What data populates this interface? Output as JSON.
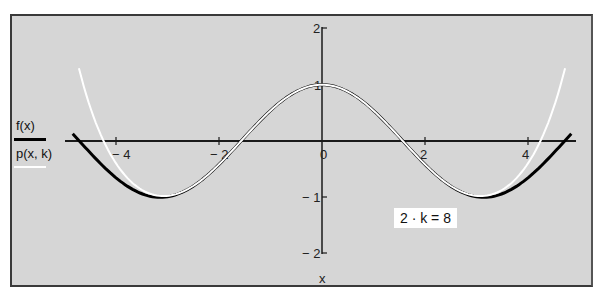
{
  "chart_data": {
    "type": "line",
    "title": "",
    "xlabel": "x",
    "ylabel": "",
    "xlim": [
      -4.9,
      4.9
    ],
    "ylim": [
      -2,
      2
    ],
    "x_ticks": [
      -4,
      -2,
      0,
      2,
      4
    ],
    "x_tick_labels": [
      "− 4",
      "− 2",
      "0",
      "2",
      "4"
    ],
    "y_ticks": [
      2,
      1,
      -1,
      -2
    ],
    "y_tick_labels": [
      "2",
      "1",
      "− 1",
      "− 2"
    ],
    "grid": false,
    "legend_position": "left",
    "series": [
      {
        "name": "f(x)",
        "color": "#000000",
        "description": "cos(x)",
        "x": [
          -4.8,
          -4.5,
          -4.0,
          -3.5,
          -3.14,
          -3.0,
          -2.5,
          -2.0,
          -1.5,
          -1.0,
          -0.5,
          0.0,
          0.5,
          1.0,
          1.5,
          2.0,
          2.5,
          3.0,
          3.14,
          3.5,
          4.0,
          4.5,
          4.8
        ],
        "values": [
          0.09,
          -0.21,
          -0.65,
          -0.94,
          -1.0,
          -0.99,
          -0.8,
          -0.42,
          0.07,
          0.54,
          0.88,
          1.0,
          0.88,
          0.54,
          0.07,
          -0.42,
          -0.8,
          -0.99,
          -1.0,
          -0.94,
          -0.65,
          -0.21,
          0.09
        ]
      },
      {
        "name": "p(x, k)",
        "color": "#ffffff",
        "description": "Taylor polynomial of cos(x) of degree 2k = 8",
        "x": [
          -4.7,
          -4.5,
          -4.0,
          -3.5,
          -3.14,
          -3.0,
          -2.5,
          -2.0,
          -1.5,
          -1.0,
          -0.5,
          0.0,
          0.5,
          1.0,
          1.5,
          2.0,
          2.5,
          3.0,
          3.14,
          3.5,
          4.0,
          4.5,
          4.7
        ],
        "values": [
          1.22,
          0.61,
          -0.31,
          -0.84,
          -0.98,
          -0.98,
          -0.8,
          -0.42,
          0.07,
          0.54,
          0.88,
          1.0,
          0.88,
          0.54,
          0.07,
          -0.42,
          -0.8,
          -0.98,
          -0.98,
          -0.84,
          -0.31,
          0.61,
          1.22
        ]
      }
    ],
    "annotations": [
      "2 · k = 8"
    ]
  },
  "legend": {
    "f_label": "f(x)",
    "p_label": "p(x, k)",
    "f_color": "#000000",
    "p_color": "#ffffff"
  },
  "parameter": {
    "text": "2 · k = 8"
  },
  "axes": {
    "x_label": "x",
    "x_tick_labels": [
      "− 4",
      "− 2",
      "0",
      "2",
      "4"
    ],
    "y_tick_labels": [
      "2",
      "1",
      "− 1",
      "− 2"
    ]
  },
  "colors": {
    "background": "#d6d6d6",
    "frame": "#3a3a3a",
    "axis": "#1a1a1a"
  }
}
